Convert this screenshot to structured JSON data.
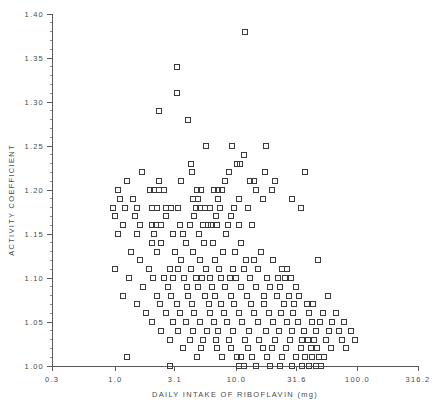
{
  "chart_data": {
    "type": "scatter",
    "title": "",
    "xlabel": "DAILY INTAKE OF RIBOFLAVIN (mg)",
    "ylabel": "ACTIVITY COEFFICIENT",
    "xscale": "log",
    "yscale": "linear",
    "xlim": [
      0.3,
      316.2
    ],
    "ylim": [
      1.0,
      1.4
    ],
    "grid": false,
    "legend": null,
    "marker": "open-square",
    "marker_color": "#3b3b3b",
    "xticks": [
      {
        "value": 0.3,
        "label": "0.3"
      },
      {
        "value": 1.0,
        "label": "1.0"
      },
      {
        "value": 3.1,
        "label": "3.1"
      },
      {
        "value": 10.0,
        "label": "10.0"
      },
      {
        "value": 31.6,
        "label": "31.6"
      },
      {
        "value": 100.0,
        "label": "100.0"
      },
      {
        "value": 316.2,
        "label": "316.2"
      }
    ],
    "yticks": [
      {
        "value": 1.0,
        "label": "1.00"
      },
      {
        "value": 1.05,
        "label": "1.05"
      },
      {
        "value": 1.1,
        "label": "1.10"
      },
      {
        "value": 1.15,
        "label": "1.15"
      },
      {
        "value": 1.2,
        "label": "1.20"
      },
      {
        "value": 1.25,
        "label": "1.25"
      },
      {
        "value": 1.3,
        "label": "1.30"
      },
      {
        "value": 1.35,
        "label": "1.35"
      },
      {
        "value": 1.4,
        "label": "1.40"
      }
    ],
    "y_minor_step": 0.01,
    "points": [
      [
        11.8,
        1.38
      ],
      [
        3.2,
        1.34
      ],
      [
        3.2,
        1.31
      ],
      [
        2.3,
        1.29
      ],
      [
        4.0,
        1.28
      ],
      [
        5.6,
        1.25
      ],
      [
        9.2,
        1.25
      ],
      [
        17.5,
        1.25
      ],
      [
        11.6,
        1.24
      ],
      [
        4.2,
        1.23
      ],
      [
        10.2,
        1.23
      ],
      [
        10.7,
        1.23
      ],
      [
        1.65,
        1.22
      ],
      [
        4.3,
        1.22
      ],
      [
        8.6,
        1.22
      ],
      [
        17.2,
        1.22
      ],
      [
        37.0,
        1.22
      ],
      [
        1.25,
        1.21
      ],
      [
        2.3,
        1.21
      ],
      [
        3.5,
        1.21
      ],
      [
        8.0,
        1.21
      ],
      [
        13.0,
        1.21
      ],
      [
        13.9,
        1.21
      ],
      [
        21.0,
        1.21
      ],
      [
        1.05,
        1.2
      ],
      [
        1.95,
        1.2
      ],
      [
        2.1,
        1.2
      ],
      [
        2.3,
        1.2
      ],
      [
        2.5,
        1.2
      ],
      [
        4.7,
        1.2
      ],
      [
        5.1,
        1.2
      ],
      [
        6.5,
        1.2
      ],
      [
        7.0,
        1.2
      ],
      [
        7.6,
        1.2
      ],
      [
        14.5,
        1.2
      ],
      [
        19.5,
        1.2
      ],
      [
        1.1,
        1.19
      ],
      [
        1.4,
        1.19
      ],
      [
        4.4,
        1.19
      ],
      [
        4.8,
        1.19
      ],
      [
        7.0,
        1.19
      ],
      [
        10.5,
        1.19
      ],
      [
        16.5,
        1.19
      ],
      [
        29.0,
        1.19
      ],
      [
        0.95,
        1.18
      ],
      [
        1.2,
        1.18
      ],
      [
        1.5,
        1.18
      ],
      [
        2.0,
        1.18
      ],
      [
        2.2,
        1.18
      ],
      [
        2.6,
        1.18
      ],
      [
        2.9,
        1.18
      ],
      [
        3.3,
        1.18
      ],
      [
        4.6,
        1.18
      ],
      [
        5.0,
        1.18
      ],
      [
        5.5,
        1.18
      ],
      [
        6.0,
        1.18
      ],
      [
        7.3,
        1.18
      ],
      [
        9.5,
        1.18
      ],
      [
        12.5,
        1.18
      ],
      [
        34.0,
        1.18
      ],
      [
        1.0,
        1.17
      ],
      [
        1.45,
        1.17
      ],
      [
        2.6,
        1.17
      ],
      [
        4.5,
        1.17
      ],
      [
        6.8,
        1.17
      ],
      [
        9.0,
        1.17
      ],
      [
        1.15,
        1.16
      ],
      [
        1.6,
        1.16
      ],
      [
        2.0,
        1.16
      ],
      [
        2.15,
        1.16
      ],
      [
        2.4,
        1.16
      ],
      [
        3.4,
        1.16
      ],
      [
        4.1,
        1.16
      ],
      [
        5.3,
        1.16
      ],
      [
        5.8,
        1.16
      ],
      [
        6.2,
        1.16
      ],
      [
        6.9,
        1.16
      ],
      [
        8.5,
        1.16
      ],
      [
        10.5,
        1.16
      ],
      [
        13.5,
        1.16
      ],
      [
        1.05,
        1.15
      ],
      [
        1.5,
        1.15
      ],
      [
        2.1,
        1.15
      ],
      [
        3.0,
        1.15
      ],
      [
        3.6,
        1.15
      ],
      [
        4.9,
        1.15
      ],
      [
        8.2,
        1.15
      ],
      [
        2.0,
        1.14
      ],
      [
        2.4,
        1.14
      ],
      [
        3.8,
        1.14
      ],
      [
        5.4,
        1.14
      ],
      [
        6.4,
        1.14
      ],
      [
        11.0,
        1.14
      ],
      [
        1.35,
        1.13
      ],
      [
        2.2,
        1.13
      ],
      [
        3.1,
        1.13
      ],
      [
        4.4,
        1.13
      ],
      [
        7.8,
        1.13
      ],
      [
        9.8,
        1.13
      ],
      [
        16.0,
        1.13
      ],
      [
        47.0,
        1.12
      ],
      [
        1.6,
        1.12
      ],
      [
        3.5,
        1.12
      ],
      [
        5.0,
        1.12
      ],
      [
        6.6,
        1.12
      ],
      [
        12.0,
        1.12
      ],
      [
        14.0,
        1.12
      ],
      [
        20.0,
        1.12
      ],
      [
        1.0,
        1.11
      ],
      [
        1.9,
        1.11
      ],
      [
        2.8,
        1.11
      ],
      [
        3.3,
        1.11
      ],
      [
        4.2,
        1.11
      ],
      [
        5.6,
        1.11
      ],
      [
        7.2,
        1.11
      ],
      [
        9.4,
        1.11
      ],
      [
        11.5,
        1.11
      ],
      [
        15.0,
        1.11
      ],
      [
        24.0,
        1.11
      ],
      [
        26.0,
        1.11
      ],
      [
        1.3,
        1.1
      ],
      [
        2.05,
        1.1
      ],
      [
        2.5,
        1.1
      ],
      [
        3.0,
        1.1
      ],
      [
        3.7,
        1.1
      ],
      [
        4.6,
        1.1
      ],
      [
        5.2,
        1.1
      ],
      [
        6.1,
        1.1
      ],
      [
        7.5,
        1.1
      ],
      [
        8.8,
        1.1
      ],
      [
        10.0,
        1.1
      ],
      [
        13.0,
        1.1
      ],
      [
        18.0,
        1.1
      ],
      [
        22.0,
        1.1
      ],
      [
        25.0,
        1.1
      ],
      [
        28.0,
        1.1
      ],
      [
        1.7,
        1.09
      ],
      [
        2.7,
        1.09
      ],
      [
        3.9,
        1.09
      ],
      [
        4.8,
        1.09
      ],
      [
        6.3,
        1.09
      ],
      [
        8.0,
        1.09
      ],
      [
        11.0,
        1.09
      ],
      [
        14.5,
        1.09
      ],
      [
        19.0,
        1.09
      ],
      [
        23.0,
        1.09
      ],
      [
        31.0,
        1.09
      ],
      [
        1.15,
        1.08
      ],
      [
        2.2,
        1.08
      ],
      [
        2.9,
        1.08
      ],
      [
        4.0,
        1.08
      ],
      [
        5.5,
        1.08
      ],
      [
        6.7,
        1.08
      ],
      [
        9.0,
        1.08
      ],
      [
        12.2,
        1.08
      ],
      [
        17.0,
        1.08
      ],
      [
        21.5,
        1.08
      ],
      [
        27.0,
        1.08
      ],
      [
        33.0,
        1.08
      ],
      [
        57.0,
        1.08
      ],
      [
        1.5,
        1.07
      ],
      [
        2.35,
        1.07
      ],
      [
        3.2,
        1.07
      ],
      [
        4.3,
        1.07
      ],
      [
        5.9,
        1.07
      ],
      [
        7.4,
        1.07
      ],
      [
        9.6,
        1.07
      ],
      [
        13.2,
        1.07
      ],
      [
        16.8,
        1.07
      ],
      [
        24.5,
        1.07
      ],
      [
        30.0,
        1.07
      ],
      [
        38.0,
        1.07
      ],
      [
        43.0,
        1.07
      ],
      [
        1.8,
        1.06
      ],
      [
        2.6,
        1.06
      ],
      [
        3.4,
        1.06
      ],
      [
        4.5,
        1.06
      ],
      [
        6.0,
        1.06
      ],
      [
        7.9,
        1.06
      ],
      [
        10.5,
        1.06
      ],
      [
        14.0,
        1.06
      ],
      [
        18.5,
        1.06
      ],
      [
        23.5,
        1.06
      ],
      [
        29.5,
        1.06
      ],
      [
        40.0,
        1.06
      ],
      [
        52.0,
        1.06
      ],
      [
        66.0,
        1.06
      ],
      [
        2.0,
        1.05
      ],
      [
        3.0,
        1.05
      ],
      [
        3.8,
        1.05
      ],
      [
        5.0,
        1.05
      ],
      [
        6.5,
        1.05
      ],
      [
        8.4,
        1.05
      ],
      [
        11.2,
        1.05
      ],
      [
        15.0,
        1.05
      ],
      [
        20.0,
        1.05
      ],
      [
        26.0,
        1.05
      ],
      [
        32.0,
        1.05
      ],
      [
        42.0,
        1.05
      ],
      [
        49.0,
        1.05
      ],
      [
        62.0,
        1.05
      ],
      [
        78.0,
        1.05
      ],
      [
        2.4,
        1.04
      ],
      [
        3.3,
        1.04
      ],
      [
        4.4,
        1.04
      ],
      [
        5.7,
        1.04
      ],
      [
        7.1,
        1.04
      ],
      [
        9.3,
        1.04
      ],
      [
        12.8,
        1.04
      ],
      [
        17.5,
        1.04
      ],
      [
        22.5,
        1.04
      ],
      [
        28.5,
        1.04
      ],
      [
        36.0,
        1.04
      ],
      [
        45.0,
        1.04
      ],
      [
        58.0,
        1.04
      ],
      [
        70.0,
        1.04
      ],
      [
        88.0,
        1.04
      ],
      [
        2.8,
        1.03
      ],
      [
        4.1,
        1.03
      ],
      [
        5.3,
        1.03
      ],
      [
        6.8,
        1.03
      ],
      [
        8.7,
        1.03
      ],
      [
        11.8,
        1.03
      ],
      [
        15.5,
        1.03
      ],
      [
        21.0,
        1.03
      ],
      [
        27.5,
        1.03
      ],
      [
        35.0,
        1.03
      ],
      [
        39.0,
        1.03
      ],
      [
        44.0,
        1.03
      ],
      [
        55.0,
        1.03
      ],
      [
        75.0,
        1.03
      ],
      [
        95.0,
        1.03
      ],
      [
        3.6,
        1.02
      ],
      [
        5.1,
        1.02
      ],
      [
        6.9,
        1.02
      ],
      [
        9.1,
        1.02
      ],
      [
        12.5,
        1.02
      ],
      [
        16.5,
        1.02
      ],
      [
        19.5,
        1.02
      ],
      [
        25.5,
        1.02
      ],
      [
        34.0,
        1.02
      ],
      [
        41.0,
        1.02
      ],
      [
        46.0,
        1.02
      ],
      [
        60.0,
        1.02
      ],
      [
        80.0,
        1.02
      ],
      [
        1.25,
        1.01
      ],
      [
        4.7,
        1.01
      ],
      [
        7.6,
        1.01
      ],
      [
        10.2,
        1.01
      ],
      [
        11.0,
        1.01
      ],
      [
        13.5,
        1.01
      ],
      [
        18.0,
        1.01
      ],
      [
        24.0,
        1.01
      ],
      [
        31.0,
        1.01
      ],
      [
        37.0,
        1.01
      ],
      [
        42.0,
        1.01
      ],
      [
        48.0,
        1.01
      ],
      [
        53.0,
        1.01
      ],
      [
        2.8,
        1.0
      ],
      [
        10.5,
        1.0
      ],
      [
        11.5,
        1.0
      ],
      [
        14.5,
        1.0
      ],
      [
        19.0,
        1.0
      ],
      [
        23.0,
        1.0
      ],
      [
        29.0,
        1.0
      ],
      [
        35.0,
        1.0
      ],
      [
        40.0,
        1.0
      ],
      [
        45.0,
        1.0
      ],
      [
        50.0,
        1.0
      ]
    ]
  },
  "geometry": {
    "plot_left": 52,
    "plot_right": 418,
    "plot_bottom": 366,
    "plot_top": 14,
    "marker_size": 5
  }
}
